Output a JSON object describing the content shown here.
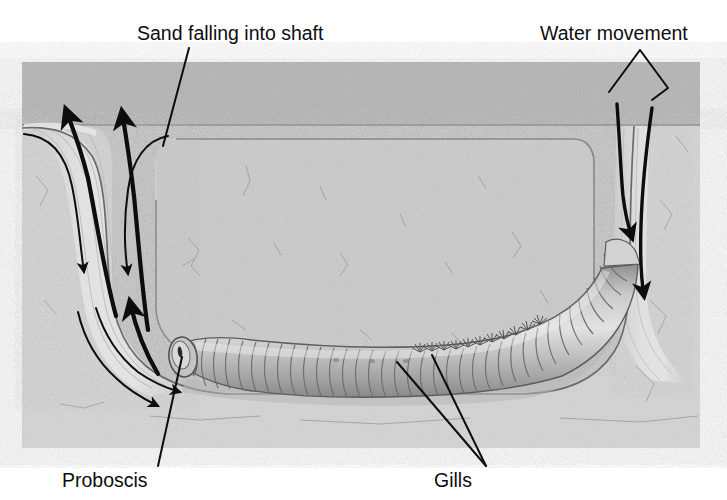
{
  "figure": {
    "width": 727,
    "height": 500
  },
  "labels": {
    "sand_falling": "Sand falling into shaft",
    "water_movement": "Water movement",
    "proboscis": "Proboscis",
    "gills": "Gills"
  },
  "annotations": [
    {
      "id": "sand-falling",
      "text": "Sand falling into shaft",
      "text_x": 137,
      "text_y": 40,
      "anchor": "start"
    },
    {
      "id": "water-movement",
      "text": "Water movement",
      "text_x": 540,
      "text_y": 40,
      "anchor": "start"
    },
    {
      "id": "proboscis",
      "text": "Proboscis",
      "text_x": 62,
      "text_y": 487,
      "anchor": "start"
    },
    {
      "id": "gills",
      "text": "Gills",
      "text_x": 434,
      "text_y": 487,
      "anchor": "start"
    }
  ],
  "colors": {
    "background": "#ffffff",
    "sand_surface": "#b9b9b9",
    "sand_body": "#c3c3c3",
    "sand_block_fill": "#cccccc",
    "burrow_channel": "#d6d6d6",
    "shaft_light": "#dedede",
    "outline": "#6f6f6f",
    "outline_dark": "#575757",
    "worm_fill": "#bdbdbd",
    "worm_shade": "#9a9a9a",
    "worm_light": "#dcdcdc",
    "ink": "#0d0d0d",
    "gill_color": "#5a5a5a"
  },
  "geometry": {
    "sand_block": {
      "x": 22,
      "y": 62,
      "width": 678,
      "height": 386
    },
    "surface_band": {
      "y": 62,
      "height": 64
    },
    "left_shaft_center_x": 112,
    "right_shaft_center_x": 641,
    "burrow_bottom_y": 372
  },
  "arrows": {
    "sand_inflow_count": 4,
    "water_up_count": 2,
    "water_down_count": 2,
    "direction_notes": "Thin curved arrows show sand falling down the left shaft; thick arrows show the upward movement of water and sediment at the left; two arrows on the right show water moving down into the tail shaft."
  },
  "anatomy": {
    "proboscis_label": "Proboscis",
    "gills_label": "Gills",
    "body_segments": 34,
    "gill_pairs": 11
  }
}
